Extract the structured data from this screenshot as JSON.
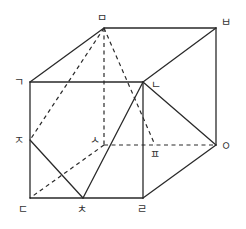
{
  "diagram": {
    "stroke_color": "#2a2a2a",
    "vertices": [
      {
        "id": "g",
        "label": "ㄱ"
      },
      {
        "id": "n",
        "label": "ㄴ"
      },
      {
        "id": "d",
        "label": "ㄷ"
      },
      {
        "id": "r",
        "label": "ㄹ"
      },
      {
        "id": "m",
        "label": "ㅁ"
      },
      {
        "id": "b",
        "label": "ㅂ"
      },
      {
        "id": "s",
        "label": "ㅅ"
      },
      {
        "id": "o",
        "label": "ㅇ"
      },
      {
        "id": "j",
        "label": "ㅈ"
      },
      {
        "id": "ch",
        "label": "ㅊ"
      },
      {
        "id": "p",
        "label": "ㅍ"
      }
    ],
    "solid_edges": [
      [
        "g",
        "n"
      ],
      [
        "n",
        "r"
      ],
      [
        "r",
        "d"
      ],
      [
        "d",
        "g"
      ],
      [
        "m",
        "b"
      ],
      [
        "b",
        "o"
      ],
      [
        "g",
        "m"
      ],
      [
        "n",
        "b"
      ],
      [
        "r",
        "o"
      ],
      [
        "n",
        "o"
      ],
      [
        "j",
        "ch"
      ],
      [
        "ch",
        "n"
      ]
    ],
    "dashed_edges": [
      [
        "m",
        "s"
      ],
      [
        "s",
        "o"
      ],
      [
        "s",
        "d"
      ],
      [
        "m",
        "j"
      ],
      [
        "m",
        "p"
      ]
    ]
  }
}
